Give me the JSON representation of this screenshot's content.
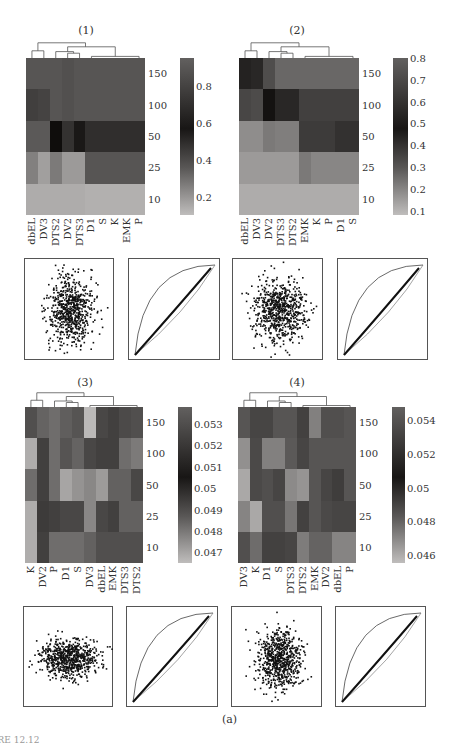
{
  "figure_caption": "(a)",
  "footer_text": "URE 12.12",
  "chart_data": [
    {
      "type": "heatmap",
      "title": "(1)",
      "columns": [
        "dbEL",
        "DV3",
        "DTS2",
        "DV2",
        "DTS3",
        "D1",
        "S",
        "K",
        "EMK",
        "P"
      ],
      "rows": [
        "150",
        "100",
        "50",
        "25",
        "10"
      ],
      "values": [
        [
          0.62,
          0.62,
          0.62,
          0.64,
          0.62,
          0.62,
          0.62,
          0.62,
          0.62,
          0.62
        ],
        [
          0.72,
          0.7,
          0.62,
          0.64,
          0.62,
          0.62,
          0.62,
          0.62,
          0.62,
          0.62
        ],
        [
          0.6,
          0.6,
          0.95,
          0.78,
          0.9,
          0.8,
          0.8,
          0.8,
          0.8,
          0.8
        ],
        [
          0.42,
          0.28,
          0.45,
          0.3,
          0.3,
          0.62,
          0.62,
          0.62,
          0.62,
          0.62
        ],
        [
          0.22,
          0.22,
          0.22,
          0.22,
          0.22,
          0.2,
          0.2,
          0.2,
          0.2,
          0.2
        ]
      ],
      "colorbar": {
        "ticks": [
          "0.8",
          "0.6",
          "0.4",
          "0.2"
        ],
        "tick_values": [
          0.8,
          0.6,
          0.4,
          0.2
        ],
        "range": [
          0.1,
          0.95
        ]
      }
    },
    {
      "type": "heatmap",
      "title": "(2)",
      "columns": [
        "dbEL",
        "DV3",
        "DV2",
        "DTS3",
        "DTS2",
        "EMK",
        "K",
        "P",
        "D1",
        "S"
      ],
      "rows": [
        "150",
        "100",
        "50",
        "25",
        "10"
      ],
      "values": [
        [
          0.72,
          0.7,
          0.55,
          0.45,
          0.45,
          0.45,
          0.45,
          0.45,
          0.45,
          0.45
        ],
        [
          0.58,
          0.56,
          0.78,
          0.7,
          0.7,
          0.6,
          0.6,
          0.6,
          0.6,
          0.6
        ],
        [
          0.3,
          0.3,
          0.38,
          0.36,
          0.36,
          0.62,
          0.62,
          0.62,
          0.66,
          0.66
        ],
        [
          0.25,
          0.25,
          0.25,
          0.25,
          0.25,
          0.38,
          0.33,
          0.33,
          0.33,
          0.33
        ],
        [
          0.18,
          0.18,
          0.18,
          0.18,
          0.18,
          0.18,
          0.18,
          0.18,
          0.18,
          0.18
        ]
      ],
      "colorbar": {
        "ticks": [
          "0.8",
          "0.7",
          "0.6",
          "0.5",
          "0.4",
          "0.3",
          "0.2",
          "0.1"
        ],
        "tick_values": [
          0.8,
          0.7,
          0.6,
          0.5,
          0.4,
          0.3,
          0.2,
          0.1
        ],
        "range": [
          0.08,
          0.8
        ]
      }
    },
    {
      "type": "heatmap",
      "title": "(3)",
      "columns": [
        "K",
        "DV2",
        "P",
        "D1",
        "S",
        "DV3",
        "dbEL",
        "EMK",
        "DTS3",
        "DTS2"
      ],
      "rows": [
        "150",
        "100",
        "50",
        "25",
        "10"
      ],
      "values": [
        [
          0.0512,
          0.0504,
          0.05,
          0.0506,
          0.051,
          0.047,
          0.0515,
          0.0518,
          0.0514,
          0.0512
        ],
        [
          0.0475,
          0.0518,
          0.05,
          0.051,
          0.0504,
          0.0515,
          0.0518,
          0.0518,
          0.05,
          0.0495
        ],
        [
          0.05,
          0.0518,
          0.05,
          0.0478,
          0.0485,
          0.049,
          0.0482,
          0.0505,
          0.0505,
          0.0515
        ],
        [
          0.0475,
          0.052,
          0.0518,
          0.0515,
          0.0515,
          0.049,
          0.0515,
          0.0518,
          0.0505,
          0.0505
        ],
        [
          0.0475,
          0.0518,
          0.05,
          0.05,
          0.05,
          0.0505,
          0.0512,
          0.0512,
          0.0512,
          0.0512
        ]
      ],
      "colorbar": {
        "ticks": [
          "0.053",
          "0.052",
          "0.051",
          "0.05",
          "0.049",
          "0.048",
          "0.047"
        ],
        "tick_values": [
          0.053,
          0.052,
          0.051,
          0.05,
          0.049,
          0.048,
          0.047
        ],
        "range": [
          0.0465,
          0.0538
        ]
      }
    },
    {
      "type": "heatmap",
      "title": "(4)",
      "columns": [
        "DV3",
        "K",
        "D1",
        "S",
        "DTS3",
        "DTS2",
        "EMK",
        "DV2",
        "dbEL",
        "P"
      ],
      "rows": [
        "150",
        "100",
        "50",
        "25",
        "10"
      ],
      "values": [
        [
          0.0512,
          0.052,
          0.052,
          0.0512,
          0.0512,
          0.0522,
          0.049,
          0.0515,
          0.0515,
          0.0512
        ],
        [
          0.0482,
          0.0518,
          0.049,
          0.049,
          0.051,
          0.052,
          0.0512,
          0.0512,
          0.0512,
          0.0512
        ],
        [
          0.047,
          0.0518,
          0.0515,
          0.052,
          0.0485,
          0.048,
          0.0512,
          0.052,
          0.0524,
          0.0512
        ],
        [
          0.0488,
          0.047,
          0.0515,
          0.0515,
          0.0495,
          0.0522,
          0.0512,
          0.0518,
          0.052,
          0.052
        ],
        [
          0.0515,
          0.05,
          0.0522,
          0.0522,
          0.052,
          0.0492,
          0.0505,
          0.0505,
          0.0488,
          0.0488
        ]
      ],
      "colorbar": {
        "ticks": [
          "0.054",
          "0.052",
          "0.05",
          "0.048",
          "0.046"
        ],
        "tick_values": [
          0.054,
          0.052,
          0.05,
          0.048,
          0.046
        ],
        "range": [
          0.0455,
          0.0548
        ]
      }
    },
    {
      "type": "scatter",
      "title": "(1) scatter",
      "description": "dense elliptical point cloud, ~1000 points"
    },
    {
      "type": "line",
      "title": "(1) QQ/probability plot",
      "description": "data curve between lower diagonal and upper convex envelope"
    },
    {
      "type": "scatter",
      "title": "(2) scatter",
      "description": "dense point cloud"
    },
    {
      "type": "line",
      "title": "(2) QQ/probability plot",
      "description": "data curve between diagonal and envelope"
    },
    {
      "type": "scatter",
      "title": "(3) scatter",
      "description": "horizontally elongated point cloud"
    },
    {
      "type": "line",
      "title": "(3) QQ/probability plot",
      "description": "data curve between diagonal and envelope"
    },
    {
      "type": "scatter",
      "title": "(4) scatter",
      "description": "roughly circular point cloud"
    },
    {
      "type": "line",
      "title": "(4) QQ/probability plot",
      "description": "data curve between diagonal and envelope"
    }
  ]
}
